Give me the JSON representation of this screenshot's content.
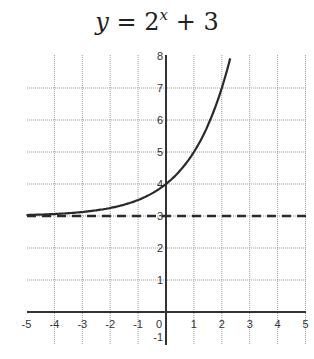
{
  "title": {
    "lhs": "y",
    "eq": " = ",
    "base": "2",
    "exp": "x",
    "rest": " + 3"
  },
  "chart_data": {
    "type": "line",
    "xlabel": "",
    "ylabel": "",
    "xlim": [
      -5,
      5
    ],
    "ylim": [
      -1,
      8
    ],
    "grid": true,
    "x_ticks": [
      -5,
      -4,
      -3,
      -2,
      -1,
      0,
      1,
      2,
      3,
      4,
      5
    ],
    "y_ticks": [
      -1,
      1,
      2,
      3,
      4,
      5,
      6,
      7,
      8
    ],
    "series": [
      {
        "name": "y = 2^x + 3",
        "style": "solid",
        "x": [
          -5,
          -4,
          -3,
          -2,
          -1,
          0,
          1,
          2,
          2.32
        ],
        "y": [
          3.03,
          3.06,
          3.13,
          3.25,
          3.5,
          4,
          5,
          7,
          8
        ]
      },
      {
        "name": "asymptote y = 3",
        "style": "dashed",
        "x": [
          -5,
          5
        ],
        "y": [
          3,
          3
        ]
      }
    ],
    "annotations": []
  },
  "axis": {
    "x_labels": [
      "-5",
      "-4",
      "-3",
      "-2",
      "-1",
      "0",
      "1",
      "2",
      "3",
      "4",
      "5"
    ],
    "y_labels": [
      "8",
      "7",
      "6",
      "5",
      "4",
      "3",
      "2",
      "1",
      "-1"
    ]
  },
  "colors": {
    "curve": "#2a2a2a",
    "grid": "#9a9a9a",
    "axis": "#333333"
  }
}
